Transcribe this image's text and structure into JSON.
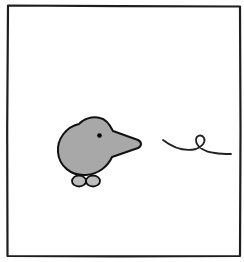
{
  "panel": {
    "description": "Single comic panel with a gray bird-like character facing right toward a curly squiggle line",
    "background_color": "#ffffff",
    "frame_color": "#1e1e1e"
  },
  "character": {
    "name": "bird",
    "body_color": "#a8a8a8",
    "outline_color": "#111111",
    "eye_color": "#000000",
    "feet_color": "#bdbdbd",
    "facing": "right"
  },
  "squiggle": {
    "name": "curly-line",
    "stroke_color": "#222222"
  }
}
